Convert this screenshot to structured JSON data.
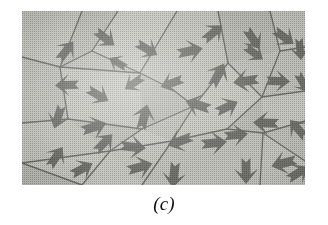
{
  "figure": {
    "caption": "(c)",
    "panel_label": "c",
    "kind": "micrograph",
    "colors": {
      "paper": "#ffffff",
      "grain_light": "#c9c9c3",
      "grain_mid": "#bdbdb7",
      "grain_dark": "#aeaea8",
      "grain_boundary": "#6d6d68",
      "arrow": "#6e6e69",
      "caption_text": "#111111"
    },
    "panel": {
      "x": 22,
      "y": 11,
      "width": 283,
      "height": 174
    }
  },
  "chart_data": {
    "type": "diagram",
    "title": "(c)",
    "xlabel": "",
    "ylabel": "",
    "xlim": [
      0,
      283
    ],
    "ylim": [
      0,
      174
    ],
    "grid": false,
    "legend": "none",
    "grain_count": 26,
    "arrow_count": 37,
    "grain_tones": [
      "#c9c9c3",
      "#c3c3bd",
      "#bdbdb7",
      "#b6b6b0",
      "#aeaea8"
    ],
    "boundary_nodes": [
      [
        0,
        48
      ],
      [
        38,
        55
      ],
      [
        70,
        40
      ],
      [
        96,
        0
      ],
      [
        118,
        62
      ],
      [
        155,
        0
      ],
      [
        150,
        78
      ],
      [
        172,
        95
      ],
      [
        206,
        52
      ],
      [
        196,
        0
      ],
      [
        240,
        86
      ],
      [
        258,
        40
      ],
      [
        283,
        36
      ],
      [
        120,
        118
      ],
      [
        88,
        140
      ],
      [
        60,
        174
      ],
      [
        150,
        130
      ],
      [
        205,
        118
      ],
      [
        241,
        122
      ],
      [
        283,
        110
      ],
      [
        0,
        112
      ],
      [
        46,
        108
      ],
      [
        283,
        150
      ],
      [
        120,
        174
      ],
      [
        196,
        174
      ],
      [
        0,
        152
      ]
    ],
    "boundary_edges": [
      [
        [
          0,
          46
        ],
        [
          38,
          56
        ]
      ],
      [
        [
          38,
          56
        ],
        [
          70,
          40
        ]
      ],
      [
        [
          70,
          40
        ],
        [
          96,
          0
        ]
      ],
      [
        [
          38,
          56
        ],
        [
          60,
          0
        ]
      ],
      [
        [
          38,
          56
        ],
        [
          46,
          108
        ]
      ],
      [
        [
          38,
          56
        ],
        [
          118,
          62
        ]
      ],
      [
        [
          70,
          40
        ],
        [
          118,
          62
        ]
      ],
      [
        [
          118,
          62
        ],
        [
          155,
          0
        ]
      ],
      [
        [
          118,
          62
        ],
        [
          150,
          78
        ]
      ],
      [
        [
          150,
          78
        ],
        [
          172,
          95
        ]
      ],
      [
        [
          172,
          95
        ],
        [
          206,
          52
        ]
      ],
      [
        [
          206,
          52
        ],
        [
          196,
          0
        ]
      ],
      [
        [
          206,
          52
        ],
        [
          240,
          86
        ]
      ],
      [
        [
          240,
          86
        ],
        [
          258,
          40
        ]
      ],
      [
        [
          258,
          40
        ],
        [
          283,
          36
        ]
      ],
      [
        [
          258,
          40
        ],
        [
          248,
          0
        ]
      ],
      [
        [
          172,
          95
        ],
        [
          120,
          118
        ]
      ],
      [
        [
          120,
          118
        ],
        [
          88,
          140
        ]
      ],
      [
        [
          88,
          140
        ],
        [
          60,
          174
        ]
      ],
      [
        [
          120,
          118
        ],
        [
          46,
          108
        ]
      ],
      [
        [
          46,
          108
        ],
        [
          0,
          112
        ]
      ],
      [
        [
          172,
          95
        ],
        [
          150,
          130
        ]
      ],
      [
        [
          150,
          130
        ],
        [
          205,
          118
        ]
      ],
      [
        [
          205,
          118
        ],
        [
          241,
          122
        ]
      ],
      [
        [
          241,
          122
        ],
        [
          283,
          110
        ]
      ],
      [
        [
          241,
          122
        ],
        [
          283,
          150
        ]
      ],
      [
        [
          241,
          122
        ],
        [
          238,
          174
        ]
      ],
      [
        [
          150,
          130
        ],
        [
          120,
          174
        ]
      ],
      [
        [
          150,
          130
        ],
        [
          88,
          140
        ]
      ],
      [
        [
          0,
          152
        ],
        [
          88,
          140
        ]
      ],
      [
        [
          240,
          86
        ],
        [
          283,
          80
        ]
      ],
      [
        [
          206,
          52
        ],
        [
          240,
          86
        ]
      ]
    ],
    "arrows": [
      {
        "x": 44,
        "y": 40,
        "angle": 38,
        "len": 24
      },
      {
        "x": 83,
        "y": 27,
        "angle": 128,
        "len": 24
      },
      {
        "x": 125,
        "y": 38,
        "angle": 120,
        "len": 24
      },
      {
        "x": 168,
        "y": 40,
        "angle": 78,
        "len": 26
      },
      {
        "x": 191,
        "y": 22,
        "angle": 50,
        "len": 24
      },
      {
        "x": 231,
        "y": 28,
        "angle": 146,
        "len": 24
      },
      {
        "x": 262,
        "y": 26,
        "angle": 126,
        "len": 24
      },
      {
        "x": 278,
        "y": 38,
        "angle": 174,
        "len": 22
      },
      {
        "x": 45,
        "y": 74,
        "angle": 268,
        "len": 24
      },
      {
        "x": 76,
        "y": 84,
        "angle": 120,
        "len": 24
      },
      {
        "x": 112,
        "y": 72,
        "angle": 236,
        "len": 22
      },
      {
        "x": 150,
        "y": 72,
        "angle": 250,
        "len": 24
      },
      {
        "x": 196,
        "y": 64,
        "angle": 28,
        "len": 26
      },
      {
        "x": 224,
        "y": 70,
        "angle": 262,
        "len": 26
      },
      {
        "x": 256,
        "y": 70,
        "angle": 92,
        "len": 24
      },
      {
        "x": 281,
        "y": 72,
        "angle": 150,
        "len": 22
      },
      {
        "x": 36,
        "y": 106,
        "angle": 198,
        "len": 24
      },
      {
        "x": 72,
        "y": 116,
        "angle": 72,
        "len": 26
      },
      {
        "x": 122,
        "y": 106,
        "angle": 14,
        "len": 26
      },
      {
        "x": 176,
        "y": 94,
        "angle": 288,
        "len": 26
      },
      {
        "x": 205,
        "y": 96,
        "angle": 64,
        "len": 24
      },
      {
        "x": 244,
        "y": 112,
        "angle": 272,
        "len": 26
      },
      {
        "x": 276,
        "y": 118,
        "angle": 318,
        "len": 24
      },
      {
        "x": 34,
        "y": 146,
        "angle": 34,
        "len": 24
      },
      {
        "x": 82,
        "y": 132,
        "angle": 44,
        "len": 24
      },
      {
        "x": 111,
        "y": 136,
        "angle": 96,
        "len": 26
      },
      {
        "x": 118,
        "y": 156,
        "angle": 74,
        "len": 26
      },
      {
        "x": 158,
        "y": 130,
        "angle": 250,
        "len": 26
      },
      {
        "x": 192,
        "y": 132,
        "angle": 84,
        "len": 26
      },
      {
        "x": 214,
        "y": 124,
        "angle": 84,
        "len": 24
      },
      {
        "x": 152,
        "y": 164,
        "angle": 186,
        "len": 26
      },
      {
        "x": 224,
        "y": 160,
        "angle": 180,
        "len": 26
      },
      {
        "x": 262,
        "y": 152,
        "angle": 256,
        "len": 26
      },
      {
        "x": 276,
        "y": 162,
        "angle": 58,
        "len": 24
      },
      {
        "x": 232,
        "y": 42,
        "angle": 126,
        "len": 22
      },
      {
        "x": 96,
        "y": 52,
        "angle": 300,
        "len": 20
      },
      {
        "x": 60,
        "y": 158,
        "angle": 62,
        "len": 24
      }
    ]
  }
}
